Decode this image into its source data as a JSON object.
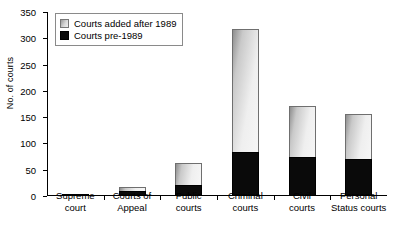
{
  "chart_data": {
    "type": "bar",
    "subtype": "stacked-bar",
    "title": "",
    "xlabel": "",
    "ylabel": "No. of courts",
    "ylim": [
      0,
      350
    ],
    "ytick_step": 50,
    "yticks": [
      0,
      50,
      100,
      150,
      200,
      250,
      300,
      350
    ],
    "grid": false,
    "legend_position": "top-left",
    "categories": [
      "Supreme court",
      "Courts of Appeal",
      "Public courts",
      "Criminal courts",
      "Civil courts",
      "Personal Status courts"
    ],
    "category_lines": [
      [
        "Supreme",
        "court"
      ],
      [
        "Courts of",
        "Appeal"
      ],
      [
        "Public",
        "courts"
      ],
      [
        "Criminal",
        "courts"
      ],
      [
        "Civil",
        "courts"
      ],
      [
        "Personal",
        "Status courts"
      ]
    ],
    "series": [
      {
        "name": "Courts pre-1989",
        "color": "#0a0a0a",
        "values": [
          1,
          10,
          21,
          84,
          74,
          70
        ]
      },
      {
        "name": "Courts added after 1989",
        "color": "#e0e0e0",
        "values": [
          0,
          8,
          42,
          233,
          97,
          86
        ]
      }
    ],
    "totals": [
      1,
      18,
      63,
      317,
      171,
      156
    ]
  },
  "legend": {
    "items": [
      {
        "label": "Courts added after 1989",
        "swatch": "swatch-after"
      },
      {
        "label": "Courts pre-1989",
        "swatch": "swatch-pre"
      }
    ]
  }
}
